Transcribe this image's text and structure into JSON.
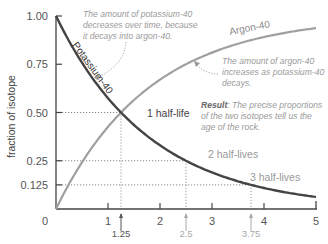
{
  "chart_data": {
    "type": "line",
    "title": "",
    "xlabel": "",
    "ylabel": "fraction of isotope",
    "xlim": [
      0,
      5
    ],
    "ylim": [
      0,
      1
    ],
    "x_ticks": [
      "0",
      "1",
      "2",
      "3",
      "4",
      "5"
    ],
    "y_ticks": [
      "0.125",
      "0.25",
      "0.50",
      "0.75",
      "1.00"
    ],
    "series": [
      {
        "name": "Potassium-40",
        "color": "#444444",
        "x": [
          0,
          1.25,
          2.5,
          3.75,
          5
        ],
        "values": [
          1.0,
          0.5,
          0.25,
          0.125,
          0.0625
        ]
      },
      {
        "name": "Argon-40",
        "color": "#a0a0a0",
        "x": [
          0,
          1.25,
          2.5,
          3.75,
          5
        ],
        "values": [
          0.0,
          0.5,
          0.75,
          0.875,
          0.9375
        ]
      }
    ],
    "half_life_markers": [
      {
        "x": 1.25,
        "label": "1.25",
        "y": 0.5,
        "text": "1 half-life"
      },
      {
        "x": 2.5,
        "label": "2.5",
        "y": 0.25,
        "text": "2 half-lives"
      },
      {
        "x": 3.75,
        "label": "3.75",
        "y": 0.125,
        "text": "3 half-lives"
      }
    ],
    "annotations": {
      "potassium_note": [
        "The amount of potassium-40",
        "decreases over time, because",
        "it decays into argon-40."
      ],
      "argon_note": [
        "The amount of argon-40",
        "increases as potassium-40",
        "decays."
      ],
      "result_bold": "Result",
      "result_text": [
        ": The precise proportions",
        "of the two isotopes tell us the",
        "age of the rock."
      ]
    },
    "grid": "dotted guides at half-life points",
    "legend": "inline labels on curves"
  }
}
